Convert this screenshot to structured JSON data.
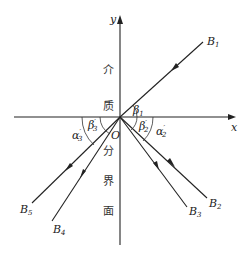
{
  "diagram": {
    "axes": {
      "x_label": "x",
      "y_label": "y",
      "origin_label": "O"
    },
    "interface_text": [
      "介",
      "质",
      "分",
      "界",
      "面"
    ],
    "rays": [
      {
        "name": "B1",
        "label": "B",
        "sub": "1",
        "role": "incident"
      },
      {
        "name": "B2",
        "label": "B",
        "sub": "2",
        "role": "reflected"
      },
      {
        "name": "B3",
        "label": "B",
        "sub": "3",
        "role": "reflected"
      },
      {
        "name": "B4",
        "label": "B",
        "sub": "4",
        "role": "refracted"
      },
      {
        "name": "B5",
        "label": "B",
        "sub": "5",
        "role": "refracted"
      }
    ],
    "angles": [
      {
        "label": "β",
        "sub": "1",
        "prime": ""
      },
      {
        "label": "β",
        "sub": "2",
        "prime": "′"
      },
      {
        "label": "α",
        "sub": "2",
        "prime": "′"
      },
      {
        "label": "β",
        "sub": "3",
        "prime": "′"
      },
      {
        "label": "α",
        "sub": "3",
        "prime": "′"
      }
    ]
  }
}
